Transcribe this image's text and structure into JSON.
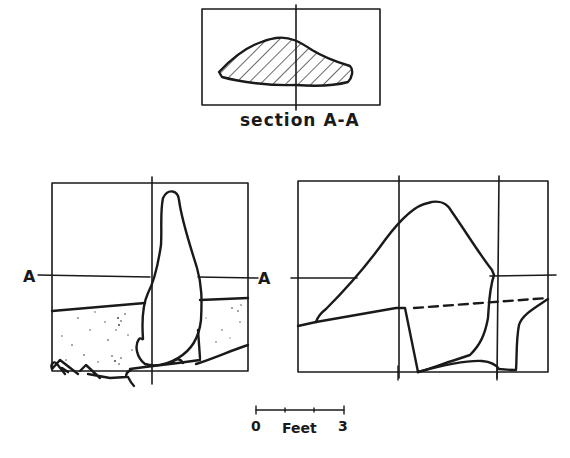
{
  "diagram": {
    "type": "technical drawing",
    "colors": {
      "ink": "#1a1a1a",
      "paper": "#ffffff"
    },
    "section_view": {
      "caption": "section A-A",
      "fill_pattern": "diagonal hatch"
    },
    "elevation_left": {
      "section_marker_left": "A",
      "section_marker_right": "A",
      "ground_fill": "stippled"
    },
    "elevation_right": {
      "reference_line": "dashed"
    },
    "scale_bar": {
      "start_label": "0",
      "unit_label": "Feet",
      "end_label": "3"
    }
  }
}
